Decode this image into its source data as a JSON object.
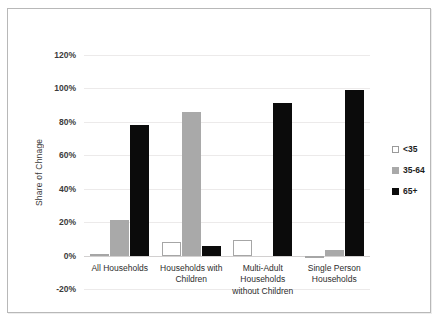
{
  "chart_data": {
    "type": "bar",
    "title": "",
    "xlabel": "",
    "ylabel": "Share of Chnage",
    "ylim": [
      -20,
      120
    ],
    "ytick_step": 20,
    "ytick_labels": [
      "120%",
      "100%",
      "80%",
      "60%",
      "40%",
      "20%",
      "0%",
      "-20%"
    ],
    "ytick_values": [
      120,
      100,
      80,
      60,
      40,
      20,
      0,
      -20
    ],
    "grid": true,
    "legend_position": "right",
    "categories": [
      "All Households",
      "Households with Children",
      "Multi-Adult Households without Children",
      "Single Person Households"
    ],
    "series": [
      {
        "name": "<35",
        "color": "#ffffff",
        "values": [
          1,
          8,
          9.5,
          -1.5
        ]
      },
      {
        "name": "35-64",
        "color": "#a9a9a9",
        "values": [
          21,
          86,
          0,
          3.5
        ]
      },
      {
        "name": "65+",
        "color": "#0b0b0b",
        "values": [
          78,
          6,
          91,
          99
        ]
      }
    ]
  },
  "legend": {
    "items": [
      {
        "label": "<35"
      },
      {
        "label": "35-64"
      },
      {
        "label": "65+"
      }
    ]
  },
  "axis": {
    "y_title": "Share of Chnage"
  },
  "category_lines": [
    [
      "All Households"
    ],
    [
      "Households with",
      "Children"
    ],
    [
      "Multi-Adult",
      "Households",
      "without Children"
    ],
    [
      "Single Person",
      "Households"
    ]
  ]
}
